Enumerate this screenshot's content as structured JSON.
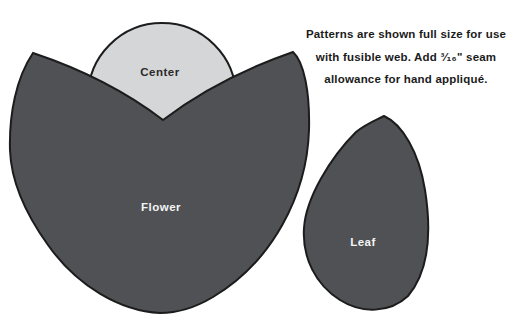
{
  "instructions": {
    "lines": [
      "Patterns are shown full size for use",
      "with fusible web. Add ³⁄₁₆\" seam",
      "allowance for hand appliqué."
    ]
  },
  "pieces": {
    "center": {
      "label": "Center",
      "fill": "#d5d6d7",
      "label_color": "#2b2b2b"
    },
    "flower": {
      "label": "Flower",
      "fill": "#4f5154",
      "label_color": "#f4f4f4"
    },
    "leaf": {
      "label": "Leaf",
      "fill": "#4f5154",
      "label_color": "#f4f4f4"
    }
  },
  "colors": {
    "outline": "#1c1c1c",
    "background": "#ffffff",
    "dark_piece": "#4f5154",
    "light_piece": "#d5d6d7"
  }
}
